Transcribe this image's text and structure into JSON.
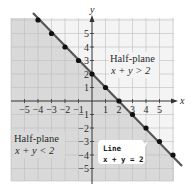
{
  "figure": {
    "axes": {
      "x_label": "x",
      "y_label": "y",
      "x_ticks": [
        "−5",
        "−4",
        "−3",
        "−2",
        "−1",
        "1",
        "2",
        "3",
        "4",
        "5"
      ],
      "y_ticks": [
        "5",
        "4",
        "3",
        "2",
        "1",
        "−1",
        "−2",
        "−3",
        "−4",
        "−5"
      ],
      "x_range": [
        -6,
        6
      ],
      "y_range": [
        -6,
        6
      ]
    },
    "regions": {
      "upper": {
        "title": "Half-plane",
        "inequality": "x + y > 2"
      },
      "lower": {
        "title": "Half-plane",
        "inequality": "x + y < 2"
      }
    },
    "line": {
      "callout_title": "Line",
      "callout_equation": "x + y = 2",
      "points": [
        [
          -4,
          6
        ],
        [
          -3,
          5
        ],
        [
          -2,
          4
        ],
        [
          -1,
          3
        ],
        [
          0,
          2
        ],
        [
          1,
          1
        ],
        [
          2,
          0
        ],
        [
          3,
          -1
        ],
        [
          4,
          -2
        ],
        [
          5,
          -3
        ],
        [
          6,
          -4
        ]
      ]
    },
    "colors": {
      "shaded_region": "#d9d9d9",
      "unshaded_region": "#f4f4f4",
      "grid": "#bdbdbd",
      "line": "#555555",
      "points": "#111111",
      "axes": "#333333"
    }
  }
}
